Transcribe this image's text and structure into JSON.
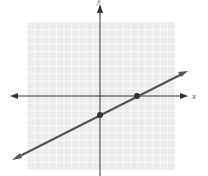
{
  "chart_data": {
    "type": "line",
    "title": "",
    "xlabel": "x",
    "ylabel": "y",
    "xlim": [
      -10,
      10
    ],
    "ylim": [
      -10,
      10
    ],
    "grid": true,
    "legend": null,
    "series": [
      {
        "name": "line",
        "points": [
          [
            0,
            -2.5
          ],
          [
            5,
            0
          ]
        ],
        "slope": 0.5,
        "intercept": -2.5,
        "arrows_both_ends": true
      }
    ],
    "marked_points": [
      [
        0,
        -2.5
      ],
      [
        5,
        0
      ]
    ]
  },
  "labels": {
    "x_axis": "x",
    "y_axis": "y"
  },
  "colors": {
    "grid_bg": "#ededed",
    "grid_line": "#ffffff",
    "axis": "#333333",
    "line": "#555555",
    "point": "#333333"
  }
}
